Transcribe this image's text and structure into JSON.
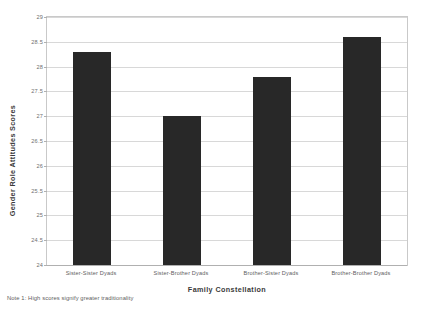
{
  "chart_data": {
    "type": "bar",
    "title": "",
    "categories": [
      "Sister-Sister Dyads",
      "Sister-Brother Dyads",
      "Brother-Sister Dyads",
      "Brother-Brother Dyads"
    ],
    "values": [
      28.3,
      27.0,
      27.8,
      28.6
    ],
    "xlabel": "Family Constellation",
    "ylabel": "Gender Role Attitudes Scores",
    "ylim": [
      24,
      29
    ],
    "ytick_labels": [
      "24",
      "24.5",
      "25",
      "25.5",
      "26",
      "26.5",
      "27",
      "27.5",
      "28",
      "28.5",
      "29"
    ],
    "ytick_values": [
      24,
      24.5,
      25,
      25.5,
      26,
      26.5,
      27,
      27.5,
      28,
      28.5,
      29
    ],
    "grid": "horizontal",
    "legend": "none",
    "bar_color": "#282828",
    "plot_border_color": "#c9c9c9",
    "gridline_color": "#d8d8d8",
    "background_color": "#ffffff"
  },
  "annotations": {
    "footnote": "Note 1: High scores signify greater traditionality"
  }
}
